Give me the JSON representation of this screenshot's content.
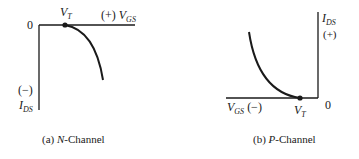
{
  "diagram": {
    "panels": [
      {
        "id": "a",
        "caption_prefix": "(a) ",
        "caption_italic": "N",
        "caption_suffix": "-Channel",
        "origin_label": "0",
        "vt_label_main": "V",
        "vt_label_sub": "T",
        "x_axis_sign": "(+)",
        "x_axis_main": "V",
        "x_axis_sub": "GS",
        "y_axis_sign": "(−)",
        "y_axis_main": "I",
        "y_axis_sub": "DS"
      },
      {
        "id": "b",
        "caption_prefix": "(b) ",
        "caption_italic": "P",
        "caption_suffix": "-Channel",
        "origin_label": "0",
        "vt_label_main": "V",
        "vt_label_sub": "T",
        "x_axis_sign": "(−)",
        "x_axis_main": "V",
        "x_axis_sub": "GS",
        "y_axis_sign": "(+)",
        "y_axis_main": "I",
        "y_axis_sub": "DS"
      }
    ],
    "colors": {
      "line": "#1a1a1a",
      "background": "#ffffff"
    }
  }
}
